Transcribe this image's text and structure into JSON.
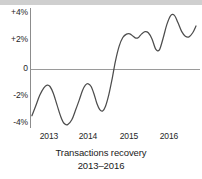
{
  "chart_data": {
    "type": "line",
    "title": "Transactions recovery",
    "subtitle": "2013–2016",
    "xlabel": "",
    "ylabel": "",
    "xlim": [
      2012.62,
      2016.62
    ],
    "ylim": [
      -4.6,
      4.6
    ],
    "grid": false,
    "legend": null,
    "zero_line": 0,
    "y_ticks": [
      {
        "value": 4,
        "label": "+4%"
      },
      {
        "value": 2,
        "label": "+2%"
      },
      {
        "value": 0,
        "label": "0"
      },
      {
        "value": -2,
        "label": "-2%"
      },
      {
        "value": -4,
        "label": "-4%"
      }
    ],
    "x_ticks": [
      {
        "value": 2013,
        "label": "2013"
      },
      {
        "value": 2014,
        "label": "2014"
      },
      {
        "value": 2015,
        "label": "2015"
      },
      {
        "value": 2016,
        "label": "2016"
      }
    ],
    "series": [
      {
        "name": "Transactions recovery",
        "color": "#4d4d4d",
        "x": [
          2012.63,
          2012.72,
          2012.82,
          2012.92,
          2013.0,
          2013.07,
          2013.15,
          2013.24,
          2013.33,
          2013.41,
          2013.5,
          2013.6,
          2013.69,
          2013.78,
          2013.86,
          2013.93,
          2014.0,
          2014.07,
          2014.14,
          2014.21,
          2014.28,
          2014.35,
          2014.42,
          2014.5,
          2014.58,
          2014.66,
          2014.75,
          2014.84,
          2014.93,
          2015.01,
          2015.09,
          2015.16,
          2015.23,
          2015.3,
          2015.38,
          2015.46,
          2015.55,
          2015.64,
          2015.73,
          2015.82,
          2015.91,
          2016.0,
          2016.09,
          2016.18,
          2016.27,
          2016.36,
          2016.45,
          2016.54,
          2016.62
        ],
        "y": [
          -3.4,
          -2.7,
          -1.9,
          -1.35,
          -1.15,
          -1.25,
          -1.75,
          -2.6,
          -3.45,
          -3.95,
          -4.05,
          -3.7,
          -3.0,
          -2.25,
          -1.55,
          -1.15,
          -1.05,
          -1.25,
          -1.8,
          -2.5,
          -2.95,
          -3.05,
          -2.7,
          -1.85,
          -0.7,
          0.6,
          1.7,
          2.35,
          2.6,
          2.62,
          2.45,
          2.3,
          2.38,
          2.62,
          2.78,
          2.7,
          2.25,
          1.5,
          1.45,
          2.3,
          3.3,
          3.95,
          4.0,
          3.45,
          2.8,
          2.45,
          2.4,
          2.7,
          3.2
        ],
        "y_end_tail": [
          3.2,
          2.85,
          2.35,
          2.0
        ]
      }
    ],
    "units": "percent"
  },
  "axis": {
    "y_axis_label_top": "+4%",
    "zero_label": "0"
  }
}
